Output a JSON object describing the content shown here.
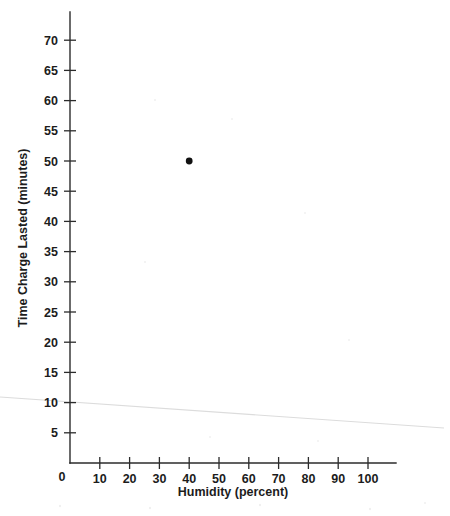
{
  "chart_data": {
    "type": "scatter",
    "title": "",
    "subtitle": "",
    "xlabel": "Humidity (percent)",
    "ylabel": "Time Charge Lasted (minutes)",
    "xlim": [
      0,
      110
    ],
    "ylim": [
      0,
      72.5
    ],
    "x_ticks": [
      0,
      10,
      20,
      30,
      40,
      50,
      60,
      70,
      80,
      90,
      100
    ],
    "x_tick_labels": [
      "0",
      "10",
      "20",
      "30",
      "40",
      "50",
      "60",
      "70",
      "80",
      "90",
      "100"
    ],
    "y_ticks": [
      5,
      10,
      15,
      20,
      25,
      30,
      35,
      40,
      45,
      50,
      55,
      60,
      65,
      70
    ],
    "y_tick_labels": [
      "5",
      "10",
      "15",
      "20",
      "25",
      "30",
      "35",
      "40",
      "45",
      "50",
      "55",
      "60",
      "65",
      "70"
    ],
    "origin_label": "0",
    "grid": false,
    "legend": false,
    "legend_position": "none",
    "series": [
      {
        "name": "data",
        "marker": "circle",
        "color": "#111111",
        "points": [
          {
            "x": 40,
            "y": 50
          }
        ]
      }
    ],
    "annotations": [
      {
        "name": "faint-trend-line",
        "type": "line",
        "color": "#dcdcdc",
        "note": "very light gray scanned line crossing the plot from left edge to right edge",
        "start": {
          "x_px": 0,
          "y_px": 397
        },
        "end": {
          "x_px": 444,
          "y_px": 428
        }
      }
    ]
  },
  "axes": {
    "y_axis_name": "y-axis",
    "x_axis_name": "x-axis"
  },
  "geometry": {
    "origin_px": {
      "x": 70,
      "y": 463
    },
    "x_px_per_unit": 2.98,
    "y_px_per_unit": 6.04,
    "y_axis_top_px": 12,
    "x_axis_right_px": 396
  }
}
